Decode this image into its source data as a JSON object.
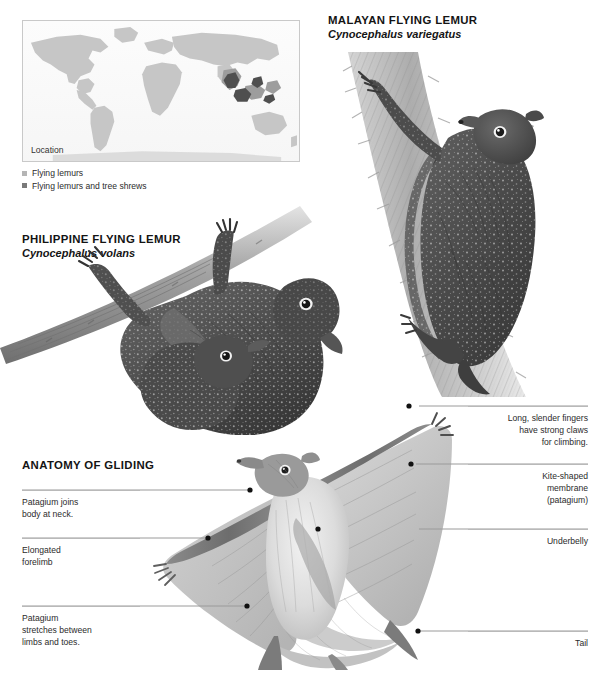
{
  "page": {
    "background": "#ffffff",
    "width": 597,
    "height": 678
  },
  "map": {
    "caption": "Location",
    "frame_color": "#c9c9c9",
    "land_color": "#c4c4c4",
    "range_color": "#8e8e8e",
    "highlight_color": "#4a4a4a",
    "legend": [
      {
        "label": "Flying lemurs",
        "color": "#b5b5b5"
      },
      {
        "label": "Flying lemurs and tree shrews",
        "color": "#7a7a7a"
      }
    ]
  },
  "species": [
    {
      "id": "malayan",
      "common_name": "MALAYAN FLYING LEMUR",
      "scientific_name": "Cynocephalus variegatus",
      "illustration": "lemur clinging to vertical tree trunk"
    },
    {
      "id": "philippine",
      "common_name": "PHILIPPINE FLYING LEMUR",
      "scientific_name": "Cynocephalus volans",
      "illustration": "lemur hanging upside down from branch with young"
    }
  ],
  "anatomy": {
    "heading": "ANATOMY OF GLIDING",
    "illustration": "flying lemur gliding with patagium fully spread, viewed from below",
    "labels_left": [
      {
        "id": "patagium-neck",
        "text": "Patagium joins\nbody at neck."
      },
      {
        "id": "elongated-forelimb",
        "text": "Elongated\nforelimb"
      },
      {
        "id": "patagium-stretch",
        "text": "Patagium\nstretches between\nlimbs and toes."
      }
    ],
    "labels_right": [
      {
        "id": "fingers-claws",
        "text": "Long, slender fingers\nhave strong claws\nfor climbing."
      },
      {
        "id": "kite-membrane",
        "text": "Kite-shaped\nmembrane\n(patagium)"
      },
      {
        "id": "underbelly",
        "text": "Underbelly"
      },
      {
        "id": "tail",
        "text": "Tail"
      }
    ]
  }
}
